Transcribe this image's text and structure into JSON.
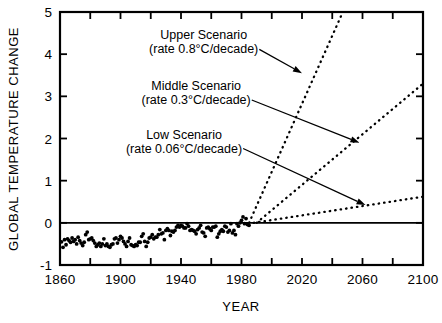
{
  "chart_data": {
    "type": "scatter",
    "title": "",
    "xlabel": "YEAR",
    "ylabel": "GLOBAL TEMPERATURE CHANGE",
    "xlim": [
      1860,
      2100
    ],
    "ylim": [
      -1,
      5
    ],
    "x_major_ticks": [
      1860,
      1900,
      1940,
      1980,
      2020,
      2060,
      2100
    ],
    "x_major_tick_labels": [
      "1860",
      "1900",
      "1940",
      "1980",
      "2020",
      "2060",
      "2100"
    ],
    "x_minor_ticks": [
      1880,
      1920,
      1960,
      2000,
      2040,
      2080
    ],
    "y_ticks": [
      -1,
      0,
      1,
      2,
      3,
      4,
      5
    ],
    "y_tick_labels": [
      "-1",
      "0",
      "1",
      "2",
      "3",
      "4",
      "5"
    ],
    "grid": false,
    "legend_position": "none",
    "zero_line": 0,
    "series": [
      {
        "name": "Observed global temperature change",
        "type": "scatter",
        "marker": "dot",
        "points": [
          [
            1861,
            -0.45
          ],
          [
            1862,
            -0.58
          ],
          [
            1863,
            -0.4
          ],
          [
            1864,
            -0.52
          ],
          [
            1865,
            -0.38
          ],
          [
            1866,
            -0.42
          ],
          [
            1867,
            -0.46
          ],
          [
            1868,
            -0.36
          ],
          [
            1869,
            -0.44
          ],
          [
            1870,
            -0.4
          ],
          [
            1871,
            -0.5
          ],
          [
            1872,
            -0.34
          ],
          [
            1873,
            -0.42
          ],
          [
            1874,
            -0.48
          ],
          [
            1875,
            -0.54
          ],
          [
            1876,
            -0.46
          ],
          [
            1877,
            -0.28
          ],
          [
            1878,
            -0.22
          ],
          [
            1879,
            -0.4
          ],
          [
            1880,
            -0.38
          ],
          [
            1881,
            -0.36
          ],
          [
            1882,
            -0.42
          ],
          [
            1883,
            -0.48
          ],
          [
            1884,
            -0.56
          ],
          [
            1885,
            -0.52
          ],
          [
            1886,
            -0.48
          ],
          [
            1887,
            -0.56
          ],
          [
            1888,
            -0.5
          ],
          [
            1889,
            -0.38
          ],
          [
            1890,
            -0.54
          ],
          [
            1891,
            -0.5
          ],
          [
            1892,
            -0.56
          ],
          [
            1893,
            -0.58
          ],
          [
            1894,
            -0.52
          ],
          [
            1895,
            -0.5
          ],
          [
            1896,
            -0.38
          ],
          [
            1897,
            -0.36
          ],
          [
            1898,
            -0.48
          ],
          [
            1899,
            -0.4
          ],
          [
            1900,
            -0.32
          ],
          [
            1901,
            -0.36
          ],
          [
            1902,
            -0.44
          ],
          [
            1903,
            -0.5
          ],
          [
            1904,
            -0.56
          ],
          [
            1905,
            -0.44
          ],
          [
            1906,
            -0.36
          ],
          [
            1907,
            -0.52
          ],
          [
            1908,
            -0.54
          ],
          [
            1909,
            -0.56
          ],
          [
            1910,
            -0.52
          ],
          [
            1911,
            -0.54
          ],
          [
            1912,
            -0.46
          ],
          [
            1913,
            -0.46
          ],
          [
            1914,
            -0.32
          ],
          [
            1915,
            -0.26
          ],
          [
            1916,
            -0.44
          ],
          [
            1917,
            -0.56
          ],
          [
            1918,
            -0.46
          ],
          [
            1919,
            -0.36
          ],
          [
            1920,
            -0.34
          ],
          [
            1921,
            -0.28
          ],
          [
            1922,
            -0.38
          ],
          [
            1923,
            -0.34
          ],
          [
            1924,
            -0.34
          ],
          [
            1925,
            -0.28
          ],
          [
            1926,
            -0.16
          ],
          [
            1927,
            -0.26
          ],
          [
            1928,
            -0.24
          ],
          [
            1929,
            -0.4
          ],
          [
            1930,
            -0.18
          ],
          [
            1931,
            -0.14
          ],
          [
            1932,
            -0.18
          ],
          [
            1933,
            -0.3
          ],
          [
            1934,
            -0.2
          ],
          [
            1935,
            -0.22
          ],
          [
            1936,
            -0.18
          ],
          [
            1937,
            -0.1
          ],
          [
            1938,
            -0.06
          ],
          [
            1939,
            -0.1
          ],
          [
            1940,
            -0.06
          ],
          [
            1941,
            -0.08
          ],
          [
            1942,
            -0.12
          ],
          [
            1943,
            -0.12
          ],
          [
            1944,
            -0.02
          ],
          [
            1945,
            -0.08
          ],
          [
            1946,
            -0.18
          ],
          [
            1947,
            -0.16
          ],
          [
            1948,
            -0.18
          ],
          [
            1949,
            -0.2
          ],
          [
            1950,
            -0.26
          ],
          [
            1951,
            -0.16
          ],
          [
            1952,
            -0.12
          ],
          [
            1953,
            -0.06
          ],
          [
            1954,
            -0.22
          ],
          [
            1955,
            -0.24
          ],
          [
            1956,
            -0.32
          ],
          [
            1957,
            -0.12
          ],
          [
            1958,
            -0.1
          ],
          [
            1959,
            -0.14
          ],
          [
            1960,
            -0.18
          ],
          [
            1961,
            -0.1
          ],
          [
            1962,
            -0.1
          ],
          [
            1963,
            -0.08
          ],
          [
            1964,
            -0.34
          ],
          [
            1965,
            -0.26
          ],
          [
            1966,
            -0.2
          ],
          [
            1967,
            -0.16
          ],
          [
            1968,
            -0.2
          ],
          [
            1969,
            -0.08
          ],
          [
            1970,
            -0.1
          ],
          [
            1971,
            -0.22
          ],
          [
            1972,
            -0.18
          ],
          [
            1973,
            -0.02
          ],
          [
            1974,
            -0.24
          ],
          [
            1975,
            -0.18
          ],
          [
            1976,
            -0.28
          ],
          [
            1977,
            -0.02
          ],
          [
            1978,
            -0.08
          ],
          [
            1979,
            0.0
          ],
          [
            1980,
            0.06
          ],
          [
            1981,
            0.14
          ],
          [
            1982,
            -0.02
          ],
          [
            1983,
            0.1
          ],
          [
            1984,
            -0.04
          ],
          [
            1985,
            -0.06
          ]
        ]
      },
      {
        "name": "Upper Scenario",
        "type": "line",
        "style": "dotted",
        "rate": "0.8°C/decade",
        "points": [
          [
            1985,
            0.0
          ],
          [
            2047,
            5.0
          ]
        ]
      },
      {
        "name": "Middle Scenario",
        "type": "line",
        "style": "dotted",
        "rate": "0.3°C/decade",
        "points": [
          [
            1990,
            0.0
          ],
          [
            2100,
            3.3
          ]
        ]
      },
      {
        "name": "Low Scenario",
        "type": "line",
        "style": "dotted",
        "rate": "0.06°C/decade",
        "points": [
          [
            1988,
            0.0
          ],
          [
            2100,
            0.62
          ]
        ]
      }
    ],
    "annotations": [
      {
        "id": "upper",
        "line1": "Upper Scenario",
        "line2": "(rate 0.8°C/decade)",
        "text_xy": [
          1955,
          4.35
        ],
        "arrow_to": [
          2020,
          3.55
        ]
      },
      {
        "id": "middle",
        "line1": "Middle Scenario",
        "line2": "(rate 0.3°C/decade)",
        "text_xy": [
          1950,
          3.15
        ],
        "arrow_to": [
          2058,
          1.9
        ]
      },
      {
        "id": "low",
        "line1": "Low Scenario",
        "line2": "(rate 0.06°C/decade)",
        "text_xy": [
          1942,
          2.0
        ],
        "arrow_to": [
          2062,
          0.42
        ]
      }
    ]
  }
}
